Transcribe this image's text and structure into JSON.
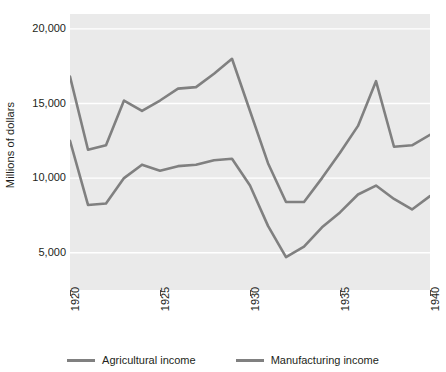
{
  "chart_data": {
    "type": "line",
    "title": "",
    "subtitle": "",
    "xlabel": "",
    "ylabel": "Millions of dollars",
    "xlim": [
      1920,
      1940
    ],
    "ylim": [
      2500,
      21000
    ],
    "grid": true,
    "grid_color": "#ffffff",
    "plot_background": "#eaeaea",
    "legend_position": "bottom",
    "x_tick_labels": [
      "1920",
      "1925",
      "1930",
      "1935",
      "1940"
    ],
    "x_ticks": [
      1920,
      1925,
      1930,
      1935,
      1940
    ],
    "y_tick_labels": [
      "20,000",
      "15,000",
      "10,000",
      "5,000"
    ],
    "y_ticks": [
      20000,
      15000,
      10000,
      5000
    ],
    "x": [
      1920,
      1921,
      1922,
      1923,
      1924,
      1925,
      1926,
      1927,
      1928,
      1929,
      1930,
      1931,
      1932,
      1933,
      1934,
      1935,
      1936,
      1937,
      1938,
      1939,
      1940
    ],
    "series": [
      {
        "name": "Agricultural income",
        "color": "#808080",
        "values": [
          16800,
          11900,
          12200,
          15200,
          14500,
          15200,
          16000,
          16100,
          17000,
          18000,
          14500,
          11000,
          8400,
          8400,
          10000,
          11700,
          13500,
          16500,
          12100,
          12200,
          12900
        ]
      },
      {
        "name": "Manufacturing income",
        "color": "#808080",
        "values": [
          12500,
          8200,
          8300,
          10000,
          10900,
          10500,
          10800,
          10900,
          11200,
          11300,
          9500,
          6800,
          4700,
          5400,
          6700,
          7700,
          8900,
          9500,
          8600,
          7900,
          8800
        ]
      }
    ]
  },
  "legend": {
    "items": [
      {
        "label": "Agricultural income",
        "color": "#808080"
      },
      {
        "label": "Manufacturing income",
        "color": "#808080"
      }
    ]
  },
  "axes": {
    "y_title": "Millions of dollars"
  }
}
